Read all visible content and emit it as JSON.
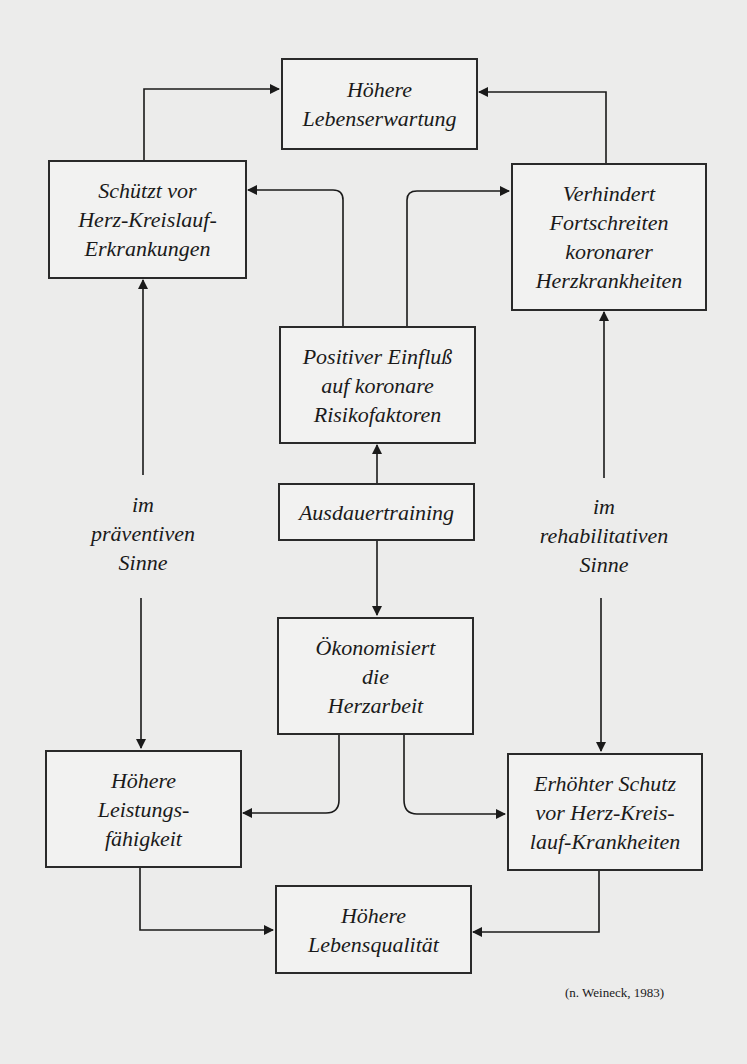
{
  "boxes": {
    "lebenserwartung": [
      "Höhere",
      "Lebenserwartung"
    ],
    "schuetzt": [
      "Schützt vor",
      "Herz-Kreislauf-",
      "Erkrankungen"
    ],
    "verhindert": [
      "Verhindert",
      "Fortschreiten",
      "koronarer",
      "Herzkrankheiten"
    ],
    "positiv": [
      "Positiver Einfluß",
      "auf koronare",
      "Risikofaktoren"
    ],
    "ausdauer": [
      "Ausdauertraining"
    ],
    "oekonom": [
      "Ökonomisiert",
      "die",
      "Herzarbeit"
    ],
    "leistung": [
      "Höhere",
      "Leistungs-",
      "fähigkeit"
    ],
    "schutz": [
      "Erhöhter Schutz",
      "vor Herz-Kreis-",
      "lauf-Krankheiten"
    ],
    "lebensqualitaet": [
      "Höhere",
      "Lebensqualität"
    ]
  },
  "labels": {
    "praeventiv": [
      "im",
      "präventiven",
      "Sinne"
    ],
    "rehabilitativ": [
      "im",
      "rehabilitativen",
      "Sinne"
    ]
  },
  "citation": "(n. Weineck, 1983)"
}
